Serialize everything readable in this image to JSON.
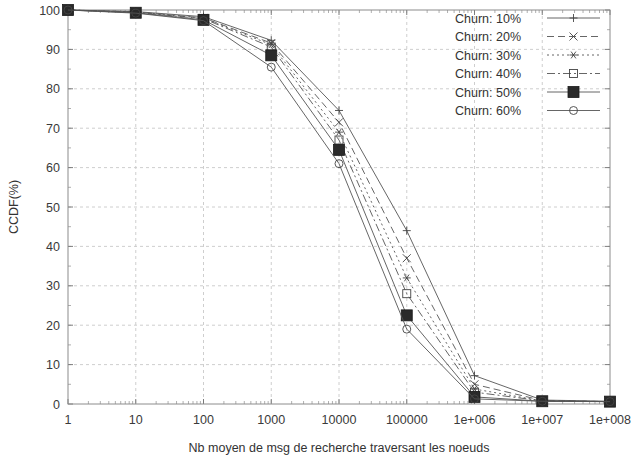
{
  "chart_data": {
    "type": "line",
    "title": "",
    "xlabel": "Nb moyen de msg de recherche traversant les noeuds",
    "ylabel": "CCDF(%)",
    "xscale": "log",
    "yscale": "linear",
    "xlim": [
      1,
      100000000
    ],
    "ylim": [
      0,
      100
    ],
    "grid": true,
    "legend_position": "top-right",
    "x_tick_labels": [
      "1",
      "10",
      "100",
      "1000",
      "10000",
      "100000",
      "1e+006",
      "1e+007",
      "1e+008"
    ],
    "x_tick_values": [
      1,
      10,
      100,
      1000,
      10000,
      100000,
      1000000,
      10000000,
      100000000
    ],
    "y_tick_labels": [
      "0",
      "10",
      "20",
      "30",
      "40",
      "50",
      "60",
      "70",
      "80",
      "90",
      "100"
    ],
    "y_tick_values": [
      0,
      10,
      20,
      30,
      40,
      50,
      60,
      70,
      80,
      90,
      100
    ],
    "x": [
      1,
      10,
      100,
      1000,
      10000,
      100000,
      1000000,
      10000000,
      100000000
    ],
    "series": [
      {
        "name": "Churn: 10%",
        "marker": "plus",
        "dash": "none",
        "values": [
          100,
          99.6,
          98.3,
          92.3,
          74.5,
          44.0,
          7.2,
          1.0,
          0.7
        ]
      },
      {
        "name": "Churn: 20%",
        "marker": "cross",
        "dash": "long",
        "values": [
          100,
          99.5,
          98.0,
          91.6,
          71.5,
          37.0,
          5.0,
          0.9,
          0.6
        ]
      },
      {
        "name": "Churn: 30%",
        "marker": "asterisk",
        "dash": "dotted",
        "values": [
          100,
          99.5,
          97.9,
          91.2,
          69.0,
          32.0,
          3.8,
          0.8,
          0.6
        ]
      },
      {
        "name": "Churn: 40%",
        "marker": "square-open",
        "dash": "dashdot",
        "values": [
          100,
          99.4,
          97.8,
          90.6,
          67.0,
          28.0,
          3.0,
          0.8,
          0.6
        ]
      },
      {
        "name": "Churn: 50%",
        "marker": "square-filled",
        "dash": "none",
        "values": [
          100,
          99.3,
          97.5,
          88.5,
          64.5,
          22.5,
          1.8,
          0.7,
          0.6
        ]
      },
      {
        "name": "Churn: 60%",
        "marker": "circle-open",
        "dash": "none",
        "values": [
          100,
          99.2,
          97.3,
          85.5,
          61.0,
          19.0,
          1.3,
          0.7,
          0.6
        ]
      }
    ]
  },
  "legend": {
    "entries": [
      {
        "label": "Churn: 10%"
      },
      {
        "label": "Churn: 20%"
      },
      {
        "label": "Churn: 30%"
      },
      {
        "label": "Churn: 40%"
      },
      {
        "label": "Churn: 50%"
      },
      {
        "label": "Churn: 60%"
      }
    ]
  },
  "colors": {
    "background": "#ffffff",
    "axis": "#8c8c8c",
    "grid": "#c8c8c8",
    "series": "#555555",
    "text": "#333333"
  }
}
